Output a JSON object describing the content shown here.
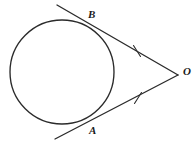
{
  "figure": {
    "background_color": "#ffffff",
    "stroke_color": "#2b2b2b",
    "width": 196,
    "height": 144,
    "labels": {
      "point_b": "B",
      "point_a": "A",
      "point_o": "O"
    },
    "circle": {
      "center_x": 62,
      "center_y": 72,
      "radius": 52,
      "stroke_width": 1.3
    },
    "external_point": {
      "x": 178,
      "y": 75
    },
    "tangent_points": {
      "b": {
        "x": 96,
        "y": 22
      },
      "a": {
        "x": 98,
        "y": 122
      }
    },
    "tangent_line_upper": {
      "name": "tangent-line-through-B",
      "x1": 57,
      "y1": 5,
      "x2": 178,
      "y2": 75
    },
    "tangent_line_lower": {
      "name": "tangent-line-through-A",
      "x1": 55,
      "y1": 139,
      "x2": 178,
      "y2": 75
    },
    "tick_marks": [
      {
        "name": "congruence-tick-OB",
        "cx": 137,
        "cy": 51,
        "angle": -30
      },
      {
        "name": "congruence-tick-OA",
        "cx": 138,
        "cy": 98,
        "angle": 28
      }
    ]
  }
}
